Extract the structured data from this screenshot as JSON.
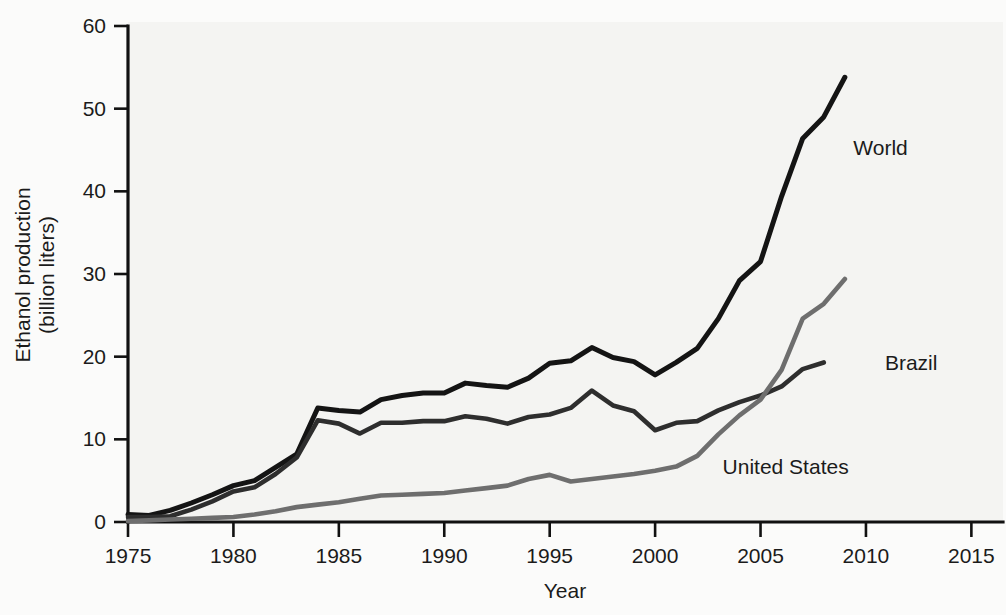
{
  "chart_data": {
    "type": "line",
    "title": "",
    "xlabel": "Year",
    "ylabel": "Ethanol production\n(billion liters)",
    "ylabel_line1": "Ethanol production",
    "ylabel_line2": "(billion liters)",
    "xlim": [
      1975,
      2016.5
    ],
    "ylim": [
      0,
      60
    ],
    "xticks": [
      1975,
      1980,
      1985,
      1990,
      1995,
      2000,
      2005,
      2010,
      2015
    ],
    "xtick_labels": [
      "1975",
      "1980",
      "1985",
      "1990",
      "1995",
      "2000",
      "2005",
      "2010",
      "2015"
    ],
    "yticks": [
      0,
      10,
      20,
      30,
      40,
      50,
      60
    ],
    "ytick_labels": [
      "0",
      "10",
      "20",
      "30",
      "40",
      "50",
      "60"
    ],
    "grid": false,
    "legend_position": "inline-right-of-line-ends",
    "units": "billion liters",
    "series": [
      {
        "name": "World",
        "color": "#141414",
        "stroke_width": 5.0,
        "label": "World",
        "label_x": 2009.4,
        "label_y": 45.3,
        "x": [
          1975,
          1976,
          1977,
          1978,
          1979,
          1980,
          1981,
          1982,
          1983,
          1984,
          1985,
          1986,
          1987,
          1988,
          1989,
          1990,
          1991,
          1992,
          1993,
          1994,
          1995,
          1996,
          1997,
          1998,
          1999,
          2000,
          2001,
          2002,
          2003,
          2004,
          2005,
          2006,
          2007,
          2008,
          2009
        ],
        "values": [
          0.9,
          0.8,
          1.4,
          2.3,
          3.3,
          4.4,
          5.0,
          6.6,
          8.2,
          13.8,
          13.5,
          13.3,
          14.8,
          15.3,
          15.6,
          15.6,
          16.8,
          16.5,
          16.3,
          17.4,
          19.2,
          19.5,
          21.1,
          19.9,
          19.4,
          17.8,
          19.3,
          21.0,
          24.6,
          29.2,
          31.5,
          39.4,
          46.4,
          49.0,
          53.8
        ]
      },
      {
        "name": "Brazil",
        "color": "#2e2e2e",
        "stroke_width": 4.6,
        "label": "Brazil",
        "label_x": 2010.9,
        "label_y": 19.2,
        "x": [
          1975,
          1976,
          1977,
          1978,
          1979,
          1980,
          1981,
          1982,
          1983,
          1984,
          1985,
          1986,
          1987,
          1988,
          1989,
          1990,
          1991,
          1992,
          1993,
          1994,
          1995,
          1996,
          1997,
          1998,
          1999,
          2000,
          2001,
          2002,
          2003,
          2004,
          2005,
          2006,
          2007,
          2008
        ],
        "values": [
          0.6,
          0.6,
          0.7,
          1.5,
          2.5,
          3.7,
          4.2,
          5.8,
          7.8,
          12.3,
          11.9,
          10.7,
          12.0,
          12.0,
          12.2,
          12.2,
          12.8,
          12.5,
          11.9,
          12.7,
          13.0,
          13.8,
          15.9,
          14.1,
          13.4,
          11.1,
          12.0,
          12.2,
          13.5,
          14.5,
          15.3,
          16.4,
          18.5,
          19.3
        ]
      },
      {
        "name": "United States",
        "color": "#6e6e6e",
        "stroke_width": 4.6,
        "label": "United States",
        "label_x": 2003.2,
        "label_y": 6.6,
        "x": [
          1975,
          1976,
          1977,
          1978,
          1979,
          1980,
          1981,
          1982,
          1983,
          1984,
          1985,
          1986,
          1987,
          1988,
          1989,
          1990,
          1991,
          1992,
          1993,
          1994,
          1995,
          1996,
          1997,
          1998,
          1999,
          2000,
          2001,
          2002,
          2003,
          2004,
          2005,
          2006,
          2007,
          2008,
          2009
        ],
        "values": [
          0.1,
          0.2,
          0.3,
          0.4,
          0.5,
          0.6,
          0.9,
          1.3,
          1.8,
          2.1,
          2.4,
          2.8,
          3.2,
          3.3,
          3.4,
          3.5,
          3.8,
          4.1,
          4.4,
          5.2,
          5.7,
          4.9,
          5.2,
          5.5,
          5.8,
          6.2,
          6.7,
          8.0,
          10.6,
          12.9,
          14.8,
          18.4,
          24.6,
          26.4,
          29.4
        ]
      }
    ]
  },
  "axes": {
    "y_label_line1": "Ethanol production",
    "y_label_line2": "(billion liters)",
    "x_label": "Year"
  }
}
